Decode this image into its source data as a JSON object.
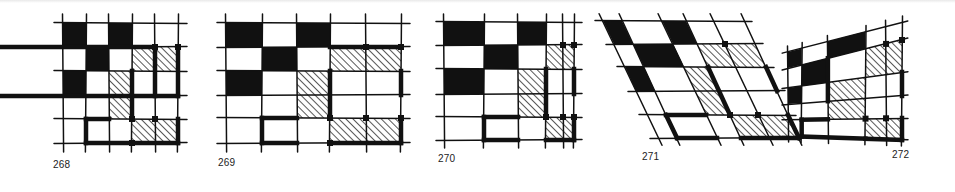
{
  "colors": {
    "ink": "#111111",
    "paper": "#ffffff",
    "hatch": "#111111"
  },
  "figures": [
    {
      "id": "268",
      "label": "268",
      "label_pos": [
        53,
        160
      ],
      "type": "grid",
      "xs": [
        63,
        86,
        109,
        132,
        155,
        178
      ],
      "ys": [
        23,
        47,
        71,
        96,
        119,
        143
      ],
      "overhang": 9,
      "black_cells": [
        [
          0,
          0
        ],
        [
          0,
          2
        ],
        [
          1,
          1
        ],
        [
          2,
          0
        ]
      ],
      "hatched_cells": [
        [
          1,
          3
        ],
        [
          1,
          4
        ],
        [
          2,
          2
        ],
        [
          3,
          2
        ],
        [
          4,
          3
        ],
        [
          4,
          4
        ]
      ],
      "thick_edges": [
        {
          "from": [
            1,
            4
          ],
          "to": [
            1,
            6
          ],
          "kind": "h"
        },
        {
          "from": [
            3,
            5
          ],
          "to": [
            3,
            6
          ],
          "kind": "v"
        },
        {
          "from": [
            2,
            2
          ],
          "to": [
            3,
            5
          ],
          "kind": "v-one",
          "comment": "none"
        },
        {
          "from": [
            1,
            4
          ],
          "to": [
            3,
            4
          ],
          "kind": "v"
        },
        {
          "from": [
            1,
            5
          ],
          "to": [
            3,
            5
          ],
          "kind": "v"
        },
        {
          "from": [
            4,
            1
          ],
          "to": [
            5,
            1
          ],
          "kind": "v"
        },
        {
          "from": [
            4,
            1
          ],
          "to": [
            4,
            2
          ],
          "kind": "h"
        },
        {
          "from": [
            5,
            1
          ],
          "to": [
            5,
            3
          ],
          "kind": "h"
        },
        {
          "from": [
            5,
            3
          ],
          "to": [
            5,
            5
          ],
          "kind": "h"
        },
        {
          "from": [
            4,
            5
          ],
          "to": [
            5,
            5
          ],
          "kind": "v"
        },
        {
          "from": [
            2,
            3
          ],
          "to": [
            4,
            3
          ],
          "kind": "v"
        }
      ],
      "dots": [
        [
          1,
          4
        ],
        [
          1,
          5
        ],
        [
          4,
          3
        ],
        [
          4,
          4
        ],
        [
          5,
          3
        ]
      ]
    },
    {
      "id": "269",
      "label": "269",
      "label_pos": [
        218,
        158
      ],
      "type": "grid",
      "xs": [
        226,
        262,
        297,
        330,
        366,
        401
      ],
      "ys": [
        23,
        47,
        71,
        95,
        118,
        143
      ],
      "overhang": 9,
      "black_cells": [
        [
          0,
          0
        ],
        [
          0,
          2
        ],
        [
          1,
          1
        ],
        [
          2,
          0
        ]
      ],
      "hatched_cells": [
        [
          1,
          3
        ],
        [
          1,
          4
        ],
        [
          2,
          2
        ],
        [
          3,
          2
        ],
        [
          4,
          3
        ],
        [
          4,
          4
        ]
      ],
      "thick_edges": [
        {
          "from": [
            1,
            3
          ],
          "to": [
            1,
            5
          ],
          "kind": "h"
        },
        {
          "from": [
            2,
            3
          ],
          "to": [
            4,
            3
          ],
          "kind": "v"
        },
        {
          "from": [
            2,
            5
          ],
          "to": [
            3,
            5
          ],
          "kind": "v"
        },
        {
          "from": [
            4,
            1
          ],
          "to": [
            5,
            1
          ],
          "kind": "v"
        },
        {
          "from": [
            4,
            1
          ],
          "to": [
            4,
            2
          ],
          "kind": "h"
        },
        {
          "from": [
            5,
            1
          ],
          "to": [
            5,
            2
          ],
          "kind": "h"
        },
        {
          "from": [
            5,
            3
          ],
          "to": [
            5,
            5
          ],
          "kind": "h"
        },
        {
          "from": [
            4,
            5
          ],
          "to": [
            5,
            5
          ],
          "kind": "v"
        }
      ],
      "dots": [
        [
          1,
          4
        ],
        [
          1,
          5
        ],
        [
          4,
          3
        ],
        [
          4,
          4
        ],
        [
          4,
          5
        ],
        [
          5,
          3
        ]
      ]
    },
    {
      "id": "270",
      "label": "270",
      "label_pos": [
        438,
        154
      ],
      "type": "grid",
      "xs": [
        444,
        484,
        518,
        546,
        563,
        574
      ],
      "ys": [
        22,
        45,
        69,
        94,
        117,
        140
      ],
      "overhang": 8,
      "black_cells": [
        [
          0,
          0
        ],
        [
          0,
          2
        ],
        [
          1,
          1
        ],
        [
          2,
          0
        ]
      ],
      "hatched_cells": [
        [
          1,
          3
        ],
        [
          1,
          4
        ],
        [
          2,
          2
        ],
        [
          3,
          2
        ],
        [
          4,
          3
        ],
        [
          4,
          4
        ]
      ],
      "thick_edges": [
        {
          "from": [
            2,
            3
          ],
          "to": [
            4,
            3
          ],
          "kind": "v"
        },
        {
          "from": [
            2,
            5
          ],
          "to": [
            3,
            5
          ],
          "kind": "v"
        },
        {
          "from": [
            4,
            1
          ],
          "to": [
            5,
            1
          ],
          "kind": "v"
        },
        {
          "from": [
            4,
            1
          ],
          "to": [
            4,
            2
          ],
          "kind": "h"
        },
        {
          "from": [
            5,
            1
          ],
          "to": [
            5,
            2
          ],
          "kind": "h"
        },
        {
          "from": [
            5,
            3
          ],
          "to": [
            5,
            5
          ],
          "kind": "h"
        },
        {
          "from": [
            4,
            5
          ],
          "to": [
            5,
            5
          ],
          "kind": "v"
        }
      ],
      "dots": [
        [
          1,
          4
        ],
        [
          1,
          5
        ],
        [
          4,
          3
        ],
        [
          4,
          4
        ],
        [
          4,
          5
        ]
      ]
    },
    {
      "id": "271",
      "label": "271",
      "label_pos": [
        642,
        152
      ],
      "type": "skew",
      "xs": [
        603,
        622,
        662,
        686,
        714
      ],
      "ys": [
        21,
        44,
        67,
        91,
        115,
        138
      ],
      "skew_per_row": 11,
      "overhang": 8,
      "black_cells": [
        [
          0,
          0
        ],
        [
          0,
          2
        ],
        [
          1,
          1
        ],
        [
          2,
          0
        ]
      ],
      "hatched_cells": [
        [
          1,
          3
        ],
        [
          1,
          4
        ],
        [
          2,
          2
        ],
        [
          3,
          2
        ],
        [
          4,
          3
        ],
        [
          4,
          4
        ]
      ],
      "thick_edges": [
        {
          "from": [
            2,
            3
          ],
          "to": [
            4,
            3
          ],
          "kind": "v"
        },
        {
          "from": [
            2,
            5
          ],
          "to": [
            3,
            5
          ],
          "kind": "v"
        },
        {
          "from": [
            4,
            1
          ],
          "to": [
            5,
            1
          ],
          "kind": "v"
        },
        {
          "from": [
            4,
            1
          ],
          "to": [
            4,
            2
          ],
          "kind": "h"
        },
        {
          "from": [
            5,
            1
          ],
          "to": [
            5,
            2
          ],
          "kind": "h"
        },
        {
          "from": [
            5,
            3
          ],
          "to": [
            5,
            5
          ],
          "kind": "h"
        },
        {
          "from": [
            4,
            5
          ],
          "to": [
            5,
            5
          ],
          "kind": "v"
        }
      ],
      "dots": [
        [
          1,
          4
        ],
        [
          4,
          3
        ],
        [
          4,
          4
        ]
      ]
    },
    {
      "id": "272",
      "label": "272",
      "label_pos": [
        892,
        150
      ],
      "type": "trapezoid",
      "left_x": 788,
      "right_x": 902,
      "left_ys": [
        52,
        68,
        88,
        104,
        120,
        136
      ],
      "right_ys": [
        22,
        40,
        72,
        96,
        118,
        140
      ],
      "col_fracs": [
        0,
        0.12,
        0.35,
        0.68,
        0.86,
        1
      ],
      "overhang": 6,
      "black_cells": [
        [
          0,
          0
        ],
        [
          0,
          2
        ],
        [
          1,
          1
        ],
        [
          2,
          0
        ]
      ],
      "hatched_cells": [
        [
          1,
          3
        ],
        [
          1,
          4
        ],
        [
          2,
          2
        ],
        [
          3,
          2
        ],
        [
          4,
          3
        ],
        [
          4,
          4
        ]
      ],
      "thick_edges": [
        {
          "from": [
            1,
            2
          ],
          "to": [
            3,
            2
          ],
          "kind": "v"
        },
        {
          "from": [
            2,
            5
          ],
          "to": [
            3,
            5
          ],
          "kind": "v"
        },
        {
          "from": [
            4,
            1
          ],
          "to": [
            5,
            1
          ],
          "kind": "v"
        },
        {
          "from": [
            4,
            1
          ],
          "to": [
            4,
            2
          ],
          "kind": "h"
        },
        {
          "from": [
            5,
            1
          ],
          "to": [
            5,
            3
          ],
          "kind": "h"
        },
        {
          "from": [
            5,
            3
          ],
          "to": [
            5,
            5
          ],
          "kind": "h"
        },
        {
          "from": [
            4,
            5
          ],
          "to": [
            5,
            5
          ],
          "kind": "v"
        }
      ],
      "dots": [
        [
          1,
          4
        ],
        [
          1,
          5
        ],
        [
          4,
          3
        ],
        [
          4,
          4
        ]
      ]
    }
  ]
}
